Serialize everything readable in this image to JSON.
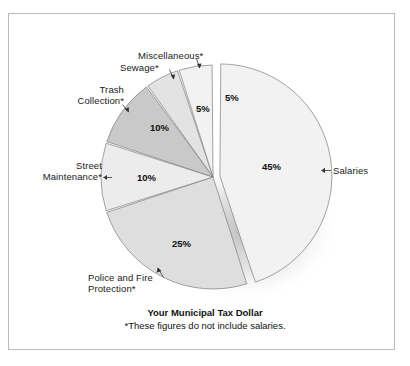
{
  "figure": {
    "frame_border_color": "#b9b9b9",
    "background": "#ffffff"
  },
  "chart_data": {
    "type": "pie",
    "title": "Your Municipal Tax Dollar",
    "subtitle": "*These figures do not include salaries.",
    "xlabel": "",
    "ylabel": "",
    "legend_position": "none",
    "grid": false,
    "total": 100,
    "units": "percent",
    "start_angle_deg": 0,
    "direction": "clockwise",
    "exploded_slice": "Salaries",
    "categories": [
      "Salaries",
      "Police and Fire Protection*",
      "Street Maintenance*",
      "Trash Collection*",
      "Sewage*",
      "Miscellaneous*"
    ],
    "values": [
      45,
      25,
      10,
      10,
      5,
      5
    ],
    "labels": [
      "45%",
      "25%",
      "10%",
      "10%",
      "5%",
      "5%"
    ],
    "colors": [
      "#f2f2f2",
      "#dedede",
      "#ececec",
      "#c9c9c9",
      "#e3e3e3",
      "#f2f2f2"
    ],
    "slices": [
      {
        "name": "Salaries",
        "value": 45,
        "label": "45%",
        "color": "#f2f2f2",
        "exploded": true
      },
      {
        "name": "Police and Fire Protection*",
        "value": 25,
        "label": "25%",
        "color": "#dedede",
        "exploded": false
      },
      {
        "name": "Street Maintenance*",
        "value": 10,
        "label": "10%",
        "color": "#ececec",
        "exploded": false
      },
      {
        "name": "Trash Collection*",
        "value": 10,
        "label": "10%",
        "color": "#c9c9c9",
        "exploded": false
      },
      {
        "name": "Sewage*",
        "value": 5,
        "label": "5%",
        "color": "#e3e3e3",
        "exploded": false
      },
      {
        "name": "Miscellaneous*",
        "value": 5,
        "label": "5%",
        "color": "#f2f2f2",
        "exploded": false
      }
    ]
  },
  "annotations": {
    "salaries": "Salaries",
    "police_fire_line1": "Police and Fire",
    "police_fire_line2": "Protection*",
    "street_line1": "Street",
    "street_line2": "Maintenance*",
    "trash_line1": "Trash",
    "trash_line2": "Collection*",
    "sewage": "Sewage*",
    "miscellaneous": "Miscellaneous*",
    "pct_salaries": "45%",
    "pct_police": "25%",
    "pct_street": "10%",
    "pct_trash": "10%",
    "pct_sewage": "5%",
    "pct_misc": "5%"
  }
}
